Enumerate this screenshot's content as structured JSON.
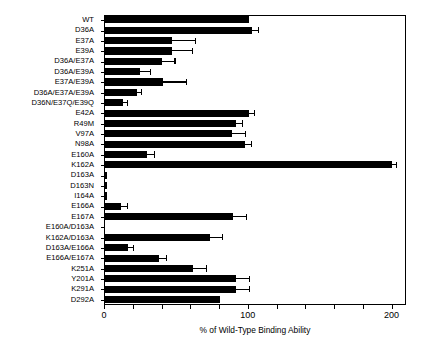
{
  "chart_data": {
    "type": "bar",
    "orientation": "horizontal",
    "title": "",
    "xlabel": "% of Wild-Type Binding Ability",
    "ylabel": "",
    "xlim": [
      0,
      210
    ],
    "xticks": [
      0,
      20,
      40,
      60,
      80,
      100,
      120,
      140,
      160,
      180,
      200
    ],
    "xticklabels": [
      "0",
      "",
      "",
      "",
      "",
      "100",
      "",
      "",
      "",
      "",
      "200"
    ],
    "grid": false,
    "legend": false,
    "bar_color": "#000000",
    "categories": [
      "WT",
      "D36A",
      "E37A",
      "E39A",
      "D36A/E37A",
      "D36A/E39A",
      "E37A/E39A",
      "D36A/E37A/E39A",
      "D36N/E37Q/E39Q",
      "E42A",
      "R49M",
      "V97A",
      "N98A",
      "E160A",
      "K162A",
      "D163A",
      "D163N",
      "I164A",
      "E166A",
      "E167A",
      "E160A/D163A",
      "K162A/D163A",
      "D163A/E166A",
      "E166A/E167A",
      "K251A",
      "Y201A",
      "K291A",
      "D292A"
    ],
    "values": [
      101,
      103,
      47,
      47,
      40,
      25,
      41,
      23,
      13,
      101,
      92,
      89,
      98,
      30,
      200,
      2,
      2,
      2,
      12,
      90,
      0,
      74,
      17,
      38,
      62,
      92,
      92,
      81
    ],
    "errors": [
      0,
      4,
      16,
      14,
      9,
      7,
      16,
      3,
      3,
      3,
      4,
      9,
      4,
      5,
      3,
      0,
      0,
      0,
      4,
      9,
      0,
      8,
      3,
      5,
      9,
      9,
      9,
      0
    ]
  }
}
